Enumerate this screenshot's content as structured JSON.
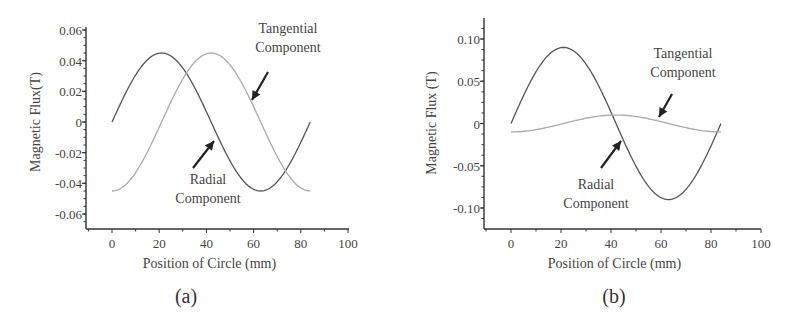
{
  "chart_data": [
    {
      "type": "line",
      "caption": "(a)",
      "title": "",
      "xlabel": "Position of Circle (mm)",
      "ylabel": "Magnetic Flux(T)",
      "xlim": [
        -11,
        100
      ],
      "ylim": [
        -0.068,
        0.062
      ],
      "xticks": [
        "0",
        "20",
        "40",
        "60",
        "80",
        "100"
      ],
      "yticks": [
        "0.06",
        "0.04",
        "0.02",
        "0",
        "-0.02",
        "-0.04",
        "-0.06"
      ],
      "grid": false,
      "legend": "none (arrow annotations)",
      "annotations": [
        {
          "text": [
            "Tangential",
            "Component"
          ],
          "target_series": "Tangential Component"
        },
        {
          "text": [
            "Radial",
            "Component"
          ],
          "target_series": "Radial Component"
        }
      ],
      "series": [
        {
          "name": "Radial Component",
          "color": "#555555",
          "amplitude": 0.045,
          "phase": "sine",
          "period_mm": 84,
          "x": [
            0,
            10.5,
            21,
            31.5,
            42,
            52.5,
            63,
            73.5,
            84
          ],
          "values": [
            0,
            0.032,
            0.045,
            0.032,
            0,
            -0.032,
            -0.045,
            -0.032,
            0
          ]
        },
        {
          "name": "Tangential Component",
          "color": "#aaaaaa",
          "amplitude": 0.045,
          "phase": "-cosine",
          "period_mm": 84,
          "x": [
            0,
            10.5,
            21,
            31.5,
            42,
            52.5,
            63,
            73.5,
            84
          ],
          "values": [
            -0.045,
            -0.032,
            0,
            0.032,
            0.045,
            0.032,
            0,
            -0.032,
            -0.045
          ]
        }
      ]
    },
    {
      "type": "line",
      "caption": "(b)",
      "title": "",
      "xlabel": "Position of Circle (mm)",
      "ylabel": "Magnetic Flux  (T)",
      "xlim": [
        -11,
        100
      ],
      "ylim": [
        -0.125,
        0.125
      ],
      "xticks": [
        "0",
        "20",
        "40",
        "60",
        "80",
        "100"
      ],
      "yticks": [
        "0.10",
        "0.05",
        "0",
        "-0.05",
        "-0.10"
      ],
      "grid": false,
      "legend": "none (arrow annotations)",
      "annotations": [
        {
          "text": [
            "Tangential",
            "Component"
          ],
          "target_series": "Tangential Component"
        },
        {
          "text": [
            "Radial",
            "Component"
          ],
          "target_series": "Radial Component"
        }
      ],
      "series": [
        {
          "name": "Radial Component",
          "color": "#555555",
          "amplitude": 0.09,
          "phase": "sine",
          "period_mm": 84,
          "x": [
            0,
            10.5,
            21,
            31.5,
            42,
            52.5,
            63,
            73.5,
            84
          ],
          "values": [
            0,
            0.064,
            0.09,
            0.064,
            0,
            -0.064,
            -0.09,
            -0.064,
            0
          ]
        },
        {
          "name": "Tangential Component",
          "color": "#aaaaaa",
          "amplitude": 0.01,
          "phase": "-cosine",
          "period_mm": 84,
          "x": [
            0,
            10.5,
            21,
            31.5,
            42,
            52.5,
            63,
            73.5,
            84
          ],
          "values": [
            -0.01,
            -0.007,
            0,
            0.007,
            0.01,
            0.007,
            0,
            -0.007,
            -0.01
          ]
        }
      ]
    }
  ]
}
